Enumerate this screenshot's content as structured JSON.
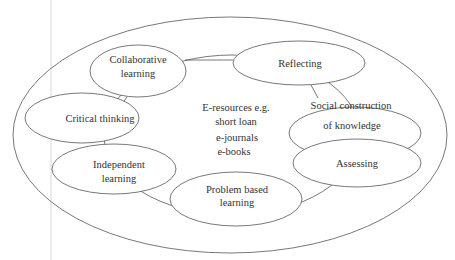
{
  "header_fragment": "",
  "diagram": {
    "center": {
      "lines": [
        "E-resources e.g.",
        "short loan",
        "e-journals",
        "e-books"
      ]
    },
    "nodes": [
      {
        "id": "collaborative-learning",
        "lines": [
          "Collaborative",
          "learning"
        ]
      },
      {
        "id": "reflecting",
        "lines": [
          "Reflecting"
        ]
      },
      {
        "id": "social-construction",
        "lines": [
          "Social construction",
          "of knowledge"
        ]
      },
      {
        "id": "assessing",
        "lines": [
          "Assessing"
        ]
      },
      {
        "id": "problem-based-learning",
        "lines": [
          "Problem based",
          "learning"
        ]
      },
      {
        "id": "independent-learning",
        "lines": [
          "Independent",
          "learning"
        ]
      },
      {
        "id": "critical-thinking",
        "lines": [
          "Critical thinking"
        ]
      }
    ],
    "colors": {
      "stroke": "#555555",
      "text": "#333333",
      "margin_line": "#cccccc",
      "background": "#ffffff"
    }
  }
}
